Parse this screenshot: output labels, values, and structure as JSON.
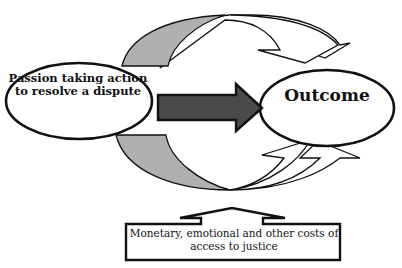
{
  "diagram": {
    "left_node": {
      "label": "Passion taking action to resolve a dispute"
    },
    "right_node": {
      "label": "Outcome"
    },
    "bottom_box": {
      "label": "Monetary, emotional and other costs of access to justice"
    },
    "top_fragment": {
      "label": ""
    },
    "center_arrow": {
      "direction": "right"
    },
    "top_arrows": {
      "count": 2,
      "direction": "left-to-right curving over"
    },
    "bottom_arrows": {
      "count": 2,
      "direction": "left-to-right curving under"
    },
    "bottom_push_arrow": {
      "direction": "up"
    },
    "colors": {
      "stroke": "#111111",
      "center_arrow_fill": "#4a4a4a",
      "curved_arrow_shaded": "#b0b0b0",
      "background": "#ffffff"
    }
  }
}
